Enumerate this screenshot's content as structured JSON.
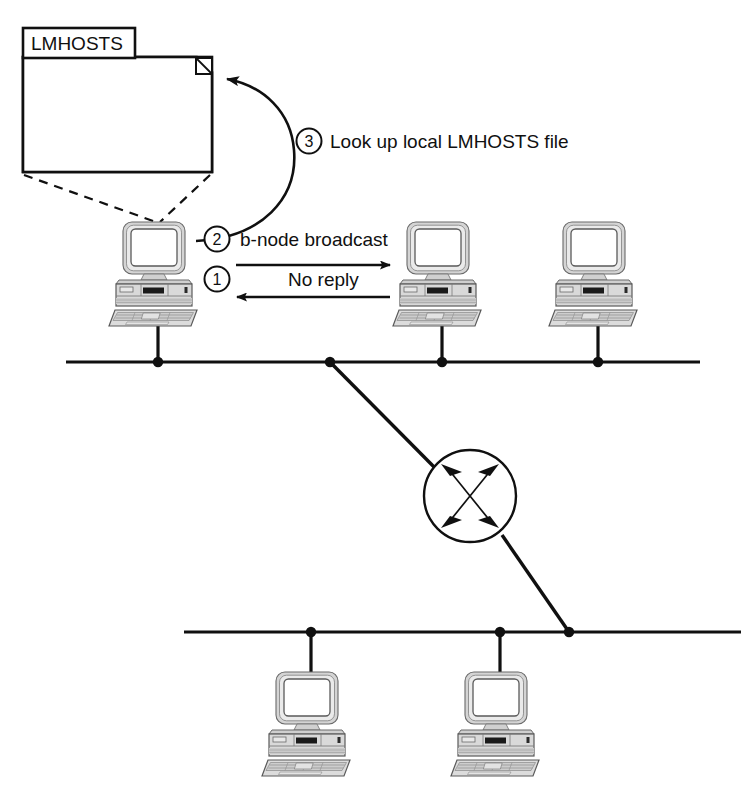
{
  "diagram": {
    "colors": {
      "stroke": "#101010",
      "background": "#ffffff",
      "pc_body": "#d8d8d8",
      "pc_shade": "#a8a8a8",
      "pc_screen": "#ffffff"
    },
    "file": {
      "name": "file-lmhosts",
      "label": "LMHOSTS",
      "tab_label": "LMHOSTS",
      "has_folded_corner": true,
      "callout_style": "dashed"
    },
    "steps": [
      {
        "number": "1",
        "label": "No reply",
        "direction": "right-to-left",
        "name": "step-1-no-reply"
      },
      {
        "number": "2",
        "label": "b-node broadcast",
        "direction": "left-to-right",
        "name": "step-2-b-node-broadcast"
      },
      {
        "number": "3",
        "label": "Look up local LMHOSTS file",
        "direction": "curved-to-file",
        "name": "step-3-lookup-lmhosts"
      }
    ],
    "segments": [
      {
        "name": "top-network-segment",
        "label": ""
      },
      {
        "name": "bottom-network-segment",
        "label": ""
      }
    ],
    "nodes": [
      {
        "name": "pc-source-top-left",
        "label": "",
        "segment": "top-network-segment"
      },
      {
        "name": "pc-top-middle",
        "label": "",
        "segment": "top-network-segment"
      },
      {
        "name": "pc-top-right",
        "label": "",
        "segment": "top-network-segment"
      },
      {
        "name": "pc-bottom-left",
        "label": "",
        "segment": "bottom-network-segment"
      },
      {
        "name": "pc-bottom-right",
        "label": "",
        "segment": "bottom-network-segment"
      }
    ],
    "router": {
      "name": "router-switch",
      "label": "",
      "symbol": "four-crossed-arrows"
    }
  }
}
